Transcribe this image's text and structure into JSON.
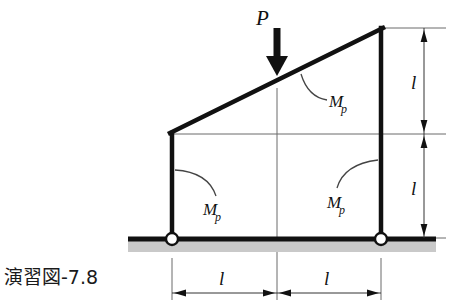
{
  "figure": {
    "caption": "演習図-7.8",
    "type": "structural-frame-diagram",
    "colors": {
      "member": "#111111",
      "thin_line": "#555555",
      "ground_hatch": "#c9c9c9",
      "support_fill": "#ffffff",
      "text": "#111111"
    },
    "load": {
      "label": "P",
      "direction": "down",
      "applied_at_x_fraction": 0.5
    },
    "hinges": [
      {
        "name": "M_p",
        "label_main": "M",
        "label_sub": "p",
        "location": "beam-right-end"
      },
      {
        "name": "M_p",
        "label_main": "M",
        "label_sub": "p",
        "location": "left-column-top"
      },
      {
        "name": "M_p",
        "label_main": "M",
        "label_sub": "p",
        "location": "right-column-top"
      }
    ],
    "dimensions": {
      "vertical": [
        {
          "label": "l",
          "position": "upper-right"
        },
        {
          "label": "l",
          "position": "lower-right"
        }
      ],
      "horizontal": [
        {
          "label": "l",
          "position": "bottom-left"
        },
        {
          "label": "l",
          "position": "bottom-right"
        }
      ]
    },
    "supports": [
      {
        "type": "pin",
        "position": "left-base"
      },
      {
        "type": "pin",
        "position": "right-base"
      }
    ]
  }
}
